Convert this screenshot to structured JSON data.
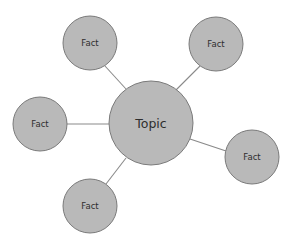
{
  "diagram": {
    "type": "mind-map",
    "colors": {
      "node_fill": "#b9b9b9",
      "node_stroke": "#7a7a7a",
      "connector": "#8a8a8a",
      "text": "#2e2e2e",
      "background": "#ffffff"
    },
    "center": {
      "label": "Topic",
      "cx": 151,
      "cy": 123,
      "r": 42
    },
    "facts": [
      {
        "label": "Fact",
        "cx": 90,
        "cy": 43,
        "r": 27,
        "line": [
          126,
          89,
          105,
          66
        ]
      },
      {
        "label": "Fact",
        "cx": 216,
        "cy": 44,
        "r": 27,
        "line": [
          176,
          90,
          200,
          66
        ]
      },
      {
        "label": "Fact",
        "cx": 40,
        "cy": 124,
        "r": 27,
        "line": [
          109,
          124,
          67,
          124
        ]
      },
      {
        "label": "Fact",
        "cx": 252,
        "cy": 157,
        "r": 27,
        "line": [
          190,
          139,
          226,
          151
        ]
      },
      {
        "label": "Fact",
        "cx": 90,
        "cy": 206,
        "r": 27,
        "line": [
          126,
          158,
          106,
          184
        ]
      }
    ]
  }
}
